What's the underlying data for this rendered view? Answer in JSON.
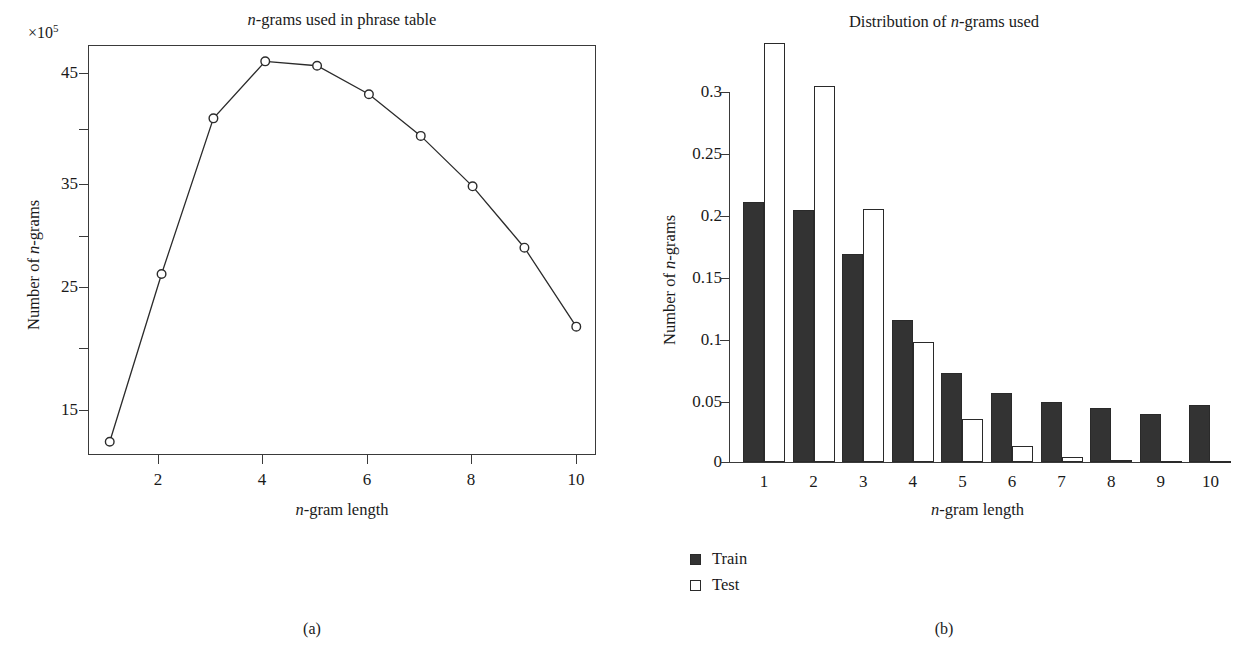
{
  "figure": {
    "panel_a_caption": "(a)",
    "panel_b_caption": "(b)"
  },
  "panel_a": {
    "title_prefix": "n",
    "title_rest": "-grams used in phrase table",
    "exponent_label": "×10",
    "exponent_sup": "5",
    "xlabel_prefix": "n",
    "xlabel_rest": "-gram length",
    "ylabel_prefix": "Number of ",
    "ylabel_ital": "n",
    "ylabel_rest": "-grams",
    "yticks": [
      "15",
      "25",
      "35",
      "45"
    ],
    "xticks": [
      "2",
      "4",
      "6",
      "8",
      "10"
    ]
  },
  "panel_b": {
    "title_prefix": "Distribution of ",
    "title_ital": "n",
    "title_rest": "-grams used",
    "xlabel_prefix": "n",
    "xlabel_rest": "-gram length",
    "ylabel_prefix": "Number of ",
    "ylabel_ital": "n",
    "ylabel_rest": "-grams",
    "yticks": [
      "0",
      "0.05",
      "0.1",
      "0.15",
      "0.2",
      "0.25",
      "0.3"
    ],
    "xticks": [
      "1",
      "2",
      "3",
      "4",
      "5",
      "6",
      "7",
      "8",
      "9",
      "10"
    ],
    "legend": [
      {
        "label": "Train",
        "swatch": "filled",
        "color": "#333333"
      },
      {
        "label": "Test",
        "swatch": "hollow",
        "color": "#ffffff"
      }
    ]
  },
  "chart_data": [
    {
      "type": "line",
      "id": "panel-a",
      "title": "n-grams used in phrase table",
      "xlabel": "n-gram length",
      "ylabel": "Number of n-grams",
      "y_scale_factor": "×10^5",
      "x": [
        1,
        2,
        3,
        4,
        5,
        6,
        7,
        8,
        9,
        10
      ],
      "values": [
        11.5,
        26.8,
        41.0,
        46.2,
        45.8,
        43.2,
        39.4,
        34.8,
        29.2,
        22.0
      ],
      "xlim": [
        0.6,
        10.4
      ],
      "ylim": [
        10.2,
        47.6
      ],
      "xticks": [
        2,
        4,
        6,
        8,
        10
      ],
      "yticks": [
        15,
        25,
        35,
        45
      ],
      "yticks_minor": [
        20,
        30,
        40
      ],
      "marker": "open-circle",
      "grid": false,
      "legend_position": "none"
    },
    {
      "type": "bar",
      "id": "panel-b",
      "title": "Distribution of n-grams used",
      "xlabel": "n-gram length",
      "ylabel": "Number of n-grams",
      "categories": [
        "1",
        "2",
        "3",
        "4",
        "5",
        "6",
        "7",
        "8",
        "9",
        "10"
      ],
      "series": [
        {
          "name": "Train",
          "color": "#333333",
          "values": [
            0.211,
            0.204,
            0.169,
            0.115,
            0.072,
            0.056,
            0.049,
            0.044,
            0.039,
            0.046
          ]
        },
        {
          "name": "Test",
          "color": "#ffffff",
          "values": [
            0.34,
            0.305,
            0.205,
            0.097,
            0.035,
            0.013,
            0.004,
            0.002,
            0.001,
            0.001
          ]
        }
      ],
      "ylim": [
        0,
        0.35
      ],
      "yticks": [
        0,
        0.05,
        0.1,
        0.15,
        0.2,
        0.25,
        0.3
      ],
      "grid": false,
      "legend_position": "bottom-left"
    }
  ]
}
